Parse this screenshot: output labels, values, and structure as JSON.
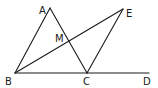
{
  "diagram": {
    "type": "geometry",
    "background": "#ffffff",
    "stroke_color": "#1a1a1a",
    "points": {
      "A": {
        "label": "A",
        "x": 50,
        "y": 8
      },
      "B": {
        "label": "B",
        "x": 15,
        "y": 73
      },
      "C": {
        "label": "C",
        "x": 87,
        "y": 73
      },
      "D": {
        "label": "D",
        "x": 149,
        "y": 73
      },
      "E": {
        "label": "E",
        "x": 123,
        "y": 9
      },
      "M": {
        "label": "M",
        "x": 69,
        "y": 42
      }
    },
    "segments": [
      {
        "name": "AB",
        "from": "A",
        "to": "B"
      },
      {
        "name": "AC",
        "from": "A",
        "to": "C"
      },
      {
        "name": "BD",
        "from": "B",
        "to": "D"
      },
      {
        "name": "BE",
        "from": "B",
        "to": "E"
      },
      {
        "name": "CE",
        "from": "C",
        "to": "E"
      }
    ],
    "labels": {
      "A": "A",
      "B": "B",
      "C": "C",
      "D": "D",
      "E": "E",
      "M": "M"
    }
  }
}
